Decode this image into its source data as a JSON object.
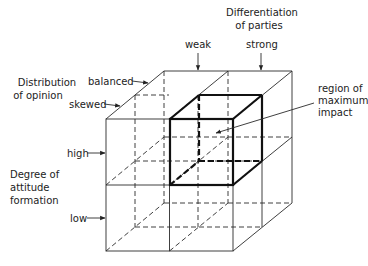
{
  "diagram": {
    "type": "3d-cube-partition",
    "axes": {
      "x": {
        "title_line1": "Differentiation",
        "title_line2": "of parties",
        "levels": [
          "weak",
          "strong"
        ]
      },
      "z": {
        "title_line1": "Distribution",
        "title_line2": "of opinion",
        "levels": [
          "balanced",
          "skewed"
        ]
      },
      "y": {
        "title_line1": "Degree of",
        "title_line2": "attitude",
        "title_line3": "formation",
        "levels": [
          "high",
          "low"
        ]
      }
    },
    "highlight": {
      "label_line1": "region of",
      "label_line2": "maximum",
      "label_line3": "impact",
      "cell": {
        "parties": "strong",
        "opinion": "skewed",
        "attitude": "high"
      }
    },
    "colors": {
      "line": "#2a2a2a",
      "highlight": "#111111",
      "background": "#ffffff"
    }
  }
}
